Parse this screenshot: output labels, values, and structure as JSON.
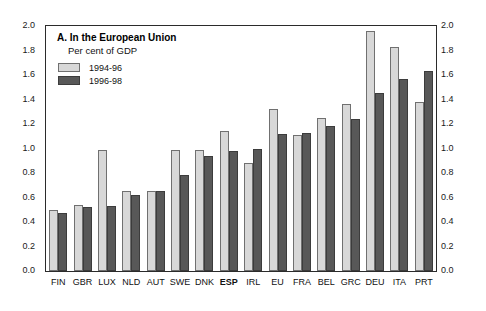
{
  "chart_data": {
    "type": "bar",
    "title": "A. In the European Union",
    "subtitle": "Per cent of GDP",
    "xlabel": "",
    "ylabel": "",
    "ylim": [
      0.0,
      2.0
    ],
    "ytick_labels": [
      "2.0",
      "1.8",
      "1.6",
      "1.4",
      "1.2",
      "1.0",
      "0.8",
      "0.6",
      "0.4",
      "0.2",
      "0.0"
    ],
    "ytick_values": [
      2.0,
      1.8,
      1.6,
      1.4,
      1.2,
      1.0,
      0.8,
      0.6,
      0.4,
      0.2,
      0.0
    ],
    "grid": false,
    "legend_position": "top-left",
    "dual_axis": true,
    "highlight_category": "ESP",
    "categories": [
      "FIN",
      "GBR",
      "LUX",
      "NLD",
      "AUT",
      "SWE",
      "DNK",
      "ESP",
      "IRL",
      "EU",
      "FRA",
      "BEL",
      "GRC",
      "DEU",
      "ITA",
      "PRT"
    ],
    "series": [
      {
        "name": "1994-96",
        "color": "#d8d8d8",
        "values": [
          0.5,
          0.54,
          0.99,
          0.65,
          0.65,
          0.99,
          0.99,
          1.14,
          0.88,
          1.32,
          1.11,
          1.25,
          1.36,
          1.96,
          1.83,
          1.38
        ]
      },
      {
        "name": "1996-98",
        "color": "#585858",
        "values": [
          0.47,
          0.52,
          0.53,
          0.62,
          0.65,
          0.78,
          0.94,
          0.98,
          1.0,
          1.12,
          1.13,
          1.18,
          1.24,
          1.45,
          1.57,
          1.63
        ]
      }
    ]
  }
}
